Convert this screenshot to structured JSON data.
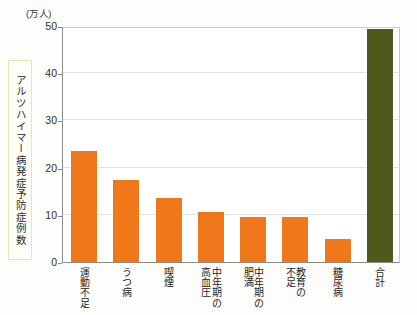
{
  "chart_data": {
    "type": "bar",
    "title": "",
    "unit_label": "(万人)",
    "ylabel": "アルツハイマー病発症予防症例数",
    "xlabel": "",
    "ylim": [
      0,
      50
    ],
    "yticks": [
      0,
      10,
      20,
      30,
      40,
      50
    ],
    "ytick_labels": [
      "0",
      "10",
      "20",
      "30",
      "40",
      "50"
    ],
    "grid": true,
    "legend": "none",
    "categories": [
      "運動不足",
      "うつ病",
      "喫煙",
      "中年期の高血圧",
      "中年期の肥満",
      "教育の不足",
      "糖尿病",
      "合計"
    ],
    "category_columns": [
      [
        "運動不足"
      ],
      [
        "うつ病"
      ],
      [
        "喫煙"
      ],
      [
        "中年期の",
        "高血圧"
      ],
      [
        "中年期の",
        "肥満"
      ],
      [
        "教育の",
        "不足"
      ],
      [
        "糖尿病"
      ],
      [
        "合計"
      ]
    ],
    "values": [
      23.5,
      17.4,
      13.6,
      10.5,
      9.6,
      9.6,
      4.8,
      49.3
    ],
    "bar_colors": [
      "#f0781a",
      "#f0781a",
      "#f0781a",
      "#f0781a",
      "#f0781a",
      "#f0781a",
      "#f0781a",
      "#4e5a1d"
    ]
  },
  "colors": {
    "orange": "#f0781a",
    "green": "#4e5a1d",
    "axis": "#8a8a88",
    "grid": "#e2e2de",
    "ytitle_border": "#ece3b6"
  }
}
